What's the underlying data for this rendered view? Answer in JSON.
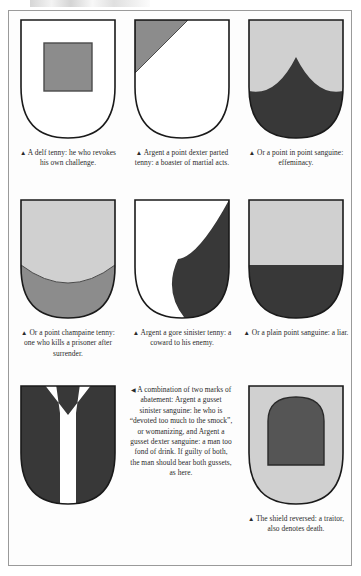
{
  "page": {
    "kind": "heraldry-plate",
    "background_color": "#ffffff",
    "frame_border_color": "#9a9a9a"
  },
  "palette": {
    "argent_white": "#ffffff",
    "or_light_gray": "#d0d0d0",
    "tenny_mid_gray": "#8c8c8c",
    "tenny_dark_gray": "#707070",
    "sanguine_dark": "#383838",
    "outline": "#1a1a1a",
    "text": "#2a2a2a"
  },
  "markers": {
    "up_triangle": "▲",
    "left_triangle": "◀"
  },
  "figures": [
    {
      "id": "delf-tenny",
      "name": "shield-delf-tenny",
      "charge": "delf",
      "field": "argent",
      "charge_tincture": "tenny",
      "marker": "▲",
      "caption": "A delf tenny: he who revokes his own challenge."
    },
    {
      "id": "point-dexter-parted-tenny",
      "name": "shield-point-dexter-parted-tenny",
      "charge": "point dexter parted",
      "field": "argent",
      "charge_tincture": "tenny",
      "marker": "▲",
      "caption": "Argent a point dexter parted tenny: a boaster of martial acts."
    },
    {
      "id": "point-in-point-sanguine",
      "name": "shield-point-in-point-sanguine",
      "charge": "point in point",
      "field": "or",
      "charge_tincture": "sanguine",
      "marker": "▲",
      "caption": "Or a point in point sanguine: effeminacy."
    },
    {
      "id": "point-champaine-tenny",
      "name": "shield-point-champaine-tenny",
      "charge": "point champaine",
      "field": "or",
      "charge_tincture": "tenny",
      "marker": "▲",
      "caption": "Or a point champaine tenny: one who kills a prisoner after surrender."
    },
    {
      "id": "gore-sinister-tenny",
      "name": "shield-gore-sinister-tenny",
      "charge": "gore sinister",
      "field": "argent",
      "charge_tincture": "tenny",
      "marker": "▲",
      "caption": "Argent a gore sinister tenny: a coward to his enemy."
    },
    {
      "id": "plain-point-sanguine",
      "name": "shield-plain-point-sanguine",
      "charge": "plain point",
      "field": "or",
      "charge_tincture": "sanguine",
      "marker": "▲",
      "caption": "Or a plain point sanguine: a liar."
    },
    {
      "id": "both-gussets-sanguine",
      "name": "shield-both-gussets-sanguine",
      "charge": "gusset dexter and gusset sinister",
      "field": "argent",
      "charge_tincture": "sanguine",
      "marker": "◀",
      "caption": "A combination of two marks of abatement: Argent a gusset sinister sanguine: he who is “devoted too much to the smock”, or womanizing, and Argent a gusset dexter sanguine: a man too fond of drink. If guilty of both, the man should bear both gussets, as here."
    },
    {
      "id": "shield-reversed",
      "name": "shield-reversed",
      "charge": "shield reversed",
      "field": "or",
      "charge_tincture": "sanguine",
      "marker": "▲",
      "caption": "The shield reversed: a traitor, also denotes death."
    }
  ]
}
